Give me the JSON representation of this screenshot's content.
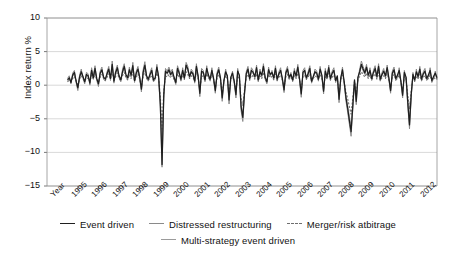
{
  "chart_data": {
    "type": "line",
    "title": "",
    "xlabel": "Year",
    "ylabel": "Index return %",
    "ylim": [
      -15,
      10
    ],
    "yticks": [
      10,
      5,
      0,
      -5,
      -10,
      -15
    ],
    "ytick_labels": [
      "10",
      "5",
      "0",
      "−5",
      "−10",
      "−15"
    ],
    "grid": true,
    "grid_axis": "y",
    "xlim": [
      1994.5,
      2012.6
    ],
    "xticks": [
      1995,
      1996,
      1997,
      1998,
      1999,
      2000,
      2001,
      2002,
      2003,
      2004,
      2005,
      2006,
      2007,
      2008,
      2009,
      2010,
      2011,
      2012
    ],
    "xtick_labels": [
      "Year",
      "1995",
      "1996",
      "1997",
      "1998",
      "1999",
      "2000",
      "2001",
      "2002",
      "2003",
      "2004",
      "2005",
      "2006",
      "2007",
      "2008",
      "2009",
      "2010",
      "2011",
      "2012"
    ],
    "legend_position": "below",
    "series": [
      {
        "name": "Event driven",
        "style": "solid",
        "color": "#1f1f1f",
        "width": 1.25,
        "values": [
          0.8,
          1.1,
          0.4,
          1.5,
          1.9,
          0.6,
          -0.4,
          1.2,
          2.0,
          1.3,
          0.5,
          1.6,
          1.4,
          0.3,
          2.2,
          1.1,
          2.5,
          1.0,
          0.2,
          1.8,
          2.3,
          1.2,
          0.9,
          1.7,
          2.4,
          1.0,
          3.1,
          0.6,
          1.9,
          2.6,
          1.4,
          0.8,
          2.0,
          2.8,
          1.6,
          1.1,
          2.3,
          1.5,
          2.9,
          0.7,
          1.8,
          2.4,
          1.2,
          -0.6,
          1.9,
          3.0,
          1.4,
          0.9,
          1.6,
          2.2,
          0.8,
          1.1,
          2.7,
          1.3,
          -2.8,
          -11.8,
          -1.5,
          2.1,
          1.8,
          2.3,
          1.6,
          2.0,
          1.2,
          0.4,
          2.5,
          1.8,
          0.9,
          2.2,
          1.1,
          3.0,
          2.4,
          1.3,
          2.0,
          1.7,
          0.6,
          2.8,
          1.4,
          -1.2,
          2.1,
          1.9,
          0.8,
          2.5,
          1.5,
          0.9,
          2.2,
          1.0,
          -0.8,
          1.6,
          2.3,
          1.1,
          -1.9,
          0.7,
          2.0,
          1.4,
          -2.2,
          1.2,
          1.8,
          0.6,
          -1.4,
          2.1,
          1.5,
          -3.2,
          -4.8,
          -1.1,
          1.7,
          2.4,
          1.0,
          2.2,
          1.9,
          1.3,
          2.6,
          0.8,
          2.0,
          1.5,
          2.8,
          1.2,
          0.5,
          2.3,
          1.6,
          1.9,
          1.1,
          2.5,
          0.9,
          1.7,
          2.2,
          1.0,
          -0.7,
          1.8,
          2.4,
          1.2,
          1.6,
          0.8,
          2.1,
          1.4,
          2.7,
          1.0,
          -1.3,
          1.9,
          2.2,
          1.1,
          1.7,
          2.5,
          0.6,
          1.3,
          2.0,
          1.8,
          0.9,
          2.4,
          1.5,
          -0.9,
          2.1,
          1.2,
          2.6,
          1.0,
          1.8,
          2.2,
          0.7,
          1.4,
          -2.1,
          1.1,
          2.3,
          0.5,
          -1.8,
          -3.4,
          -5.2,
          -6.9,
          -3.1,
          0.8,
          -2.4,
          1.2,
          2.0,
          3.1,
          2.4,
          1.8,
          2.7,
          1.5,
          2.2,
          1.0,
          1.9,
          2.5,
          1.3,
          2.8,
          0.9,
          1.6,
          2.1,
          1.4,
          2.6,
          1.1,
          -0.8,
          1.8,
          2.3,
          1.0,
          1.5,
          2.2,
          0.6,
          -1.5,
          1.9,
          1.2,
          -2.6,
          -5.9,
          -1.4,
          1.6,
          0.8,
          2.0,
          1.3,
          2.4,
          0.9,
          1.7,
          2.1,
          1.0,
          1.5,
          2.2,
          0.7,
          1.3,
          1.8,
          1.1
        ]
      },
      {
        "name": "Distressed restructuring",
        "style": "solid",
        "color": "#8a8a8a",
        "width": 1.0,
        "values": [
          1.0,
          1.4,
          0.2,
          1.8,
          2.2,
          0.4,
          -0.8,
          1.5,
          2.4,
          1.0,
          0.2,
          1.9,
          1.7,
          0.0,
          2.6,
          1.4,
          2.9,
          0.7,
          -0.2,
          2.1,
          2.7,
          0.9,
          0.6,
          2.0,
          2.8,
          0.7,
          3.6,
          0.3,
          2.2,
          3.0,
          1.1,
          0.5,
          2.4,
          3.2,
          1.3,
          0.8,
          2.7,
          1.2,
          3.4,
          0.4,
          2.1,
          2.8,
          0.9,
          -1.0,
          2.3,
          3.5,
          1.1,
          0.6,
          1.9,
          2.6,
          0.5,
          0.8,
          3.1,
          1.0,
          -3.4,
          -12.2,
          -2.0,
          2.5,
          2.1,
          2.7,
          1.9,
          2.4,
          0.9,
          0.1,
          2.9,
          2.1,
          0.6,
          2.6,
          0.8,
          3.4,
          2.8,
          1.0,
          2.4,
          2.0,
          0.3,
          3.2,
          1.1,
          -1.7,
          2.5,
          2.2,
          0.5,
          2.9,
          1.2,
          0.6,
          2.6,
          0.7,
          -1.2,
          1.9,
          2.7,
          0.8,
          -2.4,
          0.4,
          2.4,
          1.1,
          -2.8,
          0.9,
          2.1,
          0.3,
          -1.9,
          2.5,
          1.2,
          -3.8,
          -5.4,
          -1.5,
          2.0,
          2.8,
          0.7,
          2.6,
          2.2,
          1.0,
          3.0,
          0.5,
          2.4,
          1.2,
          3.2,
          0.9,
          0.2,
          2.7,
          1.3,
          2.2,
          0.8,
          2.9,
          0.6,
          2.0,
          2.6,
          0.7,
          -1.1,
          2.1,
          2.8,
          0.9,
          1.9,
          0.5,
          2.5,
          1.1,
          3.1,
          0.7,
          -1.8,
          2.2,
          2.6,
          0.8,
          2.0,
          2.9,
          0.3,
          1.0,
          2.4,
          2.1,
          0.6,
          2.8,
          1.2,
          -1.3,
          2.5,
          0.9,
          3.0,
          0.7,
          2.1,
          2.6,
          0.4,
          1.1,
          -2.6,
          0.8,
          2.7,
          0.2,
          -2.3,
          -4.0,
          -5.8,
          -7.6,
          -3.6,
          0.5,
          -2.9,
          0.9,
          2.4,
          3.6,
          2.8,
          2.1,
          3.1,
          1.2,
          2.6,
          0.7,
          2.2,
          2.9,
          1.0,
          3.2,
          0.6,
          1.9,
          2.5,
          1.1,
          3.0,
          0.8,
          -1.2,
          2.1,
          2.7,
          0.7,
          1.2,
          2.6,
          0.3,
          -1.9,
          2.2,
          0.9,
          -3.1,
          -6.5,
          -1.8,
          1.9,
          0.5,
          2.4,
          1.0,
          2.8,
          0.6,
          2.0,
          2.5,
          0.7,
          1.2,
          2.6,
          0.4,
          1.0,
          2.1,
          0.8
        ]
      },
      {
        "name": "Merger/risk atbitrage",
        "style": "dashed",
        "color": "#6e6e6e",
        "width": 1.1,
        "values": [
          0.5,
          0.8,
          0.6,
          1.0,
          1.3,
          0.7,
          0.1,
          0.9,
          1.4,
          1.0,
          0.6,
          1.1,
          1.0,
          0.5,
          1.5,
          0.9,
          1.7,
          0.8,
          0.4,
          1.2,
          1.6,
          1.0,
          0.7,
          1.2,
          1.7,
          0.9,
          2.1,
          0.6,
          1.3,
          1.8,
          1.0,
          0.7,
          1.4,
          1.9,
          1.1,
          0.8,
          1.6,
          1.0,
          2.0,
          0.6,
          1.2,
          1.7,
          0.9,
          -0.2,
          1.3,
          2.1,
          1.0,
          0.7,
          1.1,
          1.5,
          0.7,
          0.9,
          1.8,
          1.0,
          -1.6,
          -6.5,
          -0.8,
          1.4,
          1.2,
          1.6,
          1.1,
          1.4,
          0.9,
          0.5,
          1.7,
          1.2,
          0.8,
          1.5,
          0.9,
          2.0,
          1.6,
          1.0,
          1.4,
          1.2,
          0.6,
          1.9,
          1.0,
          -0.6,
          1.4,
          1.3,
          0.7,
          1.7,
          1.1,
          0.8,
          1.5,
          0.9,
          -0.4,
          1.1,
          1.6,
          0.9,
          -1.1,
          0.6,
          1.4,
          1.0,
          -1.3,
          0.9,
          1.2,
          0.6,
          -0.8,
          1.4,
          1.0,
          -2.0,
          -3.0,
          -0.7,
          1.2,
          1.6,
          0.8,
          1.5,
          1.3,
          0.9,
          1.7,
          0.7,
          1.4,
          1.0,
          1.9,
          0.9,
          0.5,
          1.6,
          1.1,
          1.3,
          0.8,
          1.7,
          0.7,
          1.2,
          1.5,
          0.8,
          -0.3,
          1.2,
          1.6,
          0.9,
          1.1,
          0.7,
          1.4,
          1.0,
          1.8,
          0.8,
          -0.7,
          1.3,
          1.5,
          0.9,
          1.2,
          1.7,
          0.6,
          1.0,
          1.4,
          1.2,
          0.8,
          1.6,
          1.1,
          -0.5,
          1.4,
          0.9,
          1.8,
          0.8,
          1.2,
          1.5,
          0.6,
          1.0,
          -1.3,
          0.8,
          1.5,
          0.5,
          -1.0,
          -2.0,
          -3.2,
          -4.3,
          -1.9,
          0.6,
          -1.4,
          0.9,
          1.3,
          2.0,
          1.6,
          1.2,
          1.8,
          1.0,
          1.5,
          0.8,
          1.3,
          1.7,
          0.9,
          1.9,
          0.7,
          1.1,
          1.4,
          1.0,
          1.7,
          0.8,
          -0.4,
          1.2,
          1.6,
          0.8,
          1.0,
          1.5,
          0.5,
          -0.9,
          1.3,
          0.9,
          -1.5,
          -3.5,
          -0.8,
          1.1,
          0.6,
          1.4,
          0.9,
          1.6,
          0.7,
          1.2,
          1.4,
          0.8,
          1.0,
          1.5,
          0.6,
          0.9,
          1.2,
          0.9
        ]
      },
      {
        "name": "Multi-strategy event driven",
        "style": "solid",
        "color": "#9b9b9b",
        "width": 1.0,
        "values": [
          0.7,
          1.0,
          0.5,
          1.3,
          1.7,
          0.6,
          -0.3,
          1.1,
          1.8,
          1.2,
          0.5,
          1.4,
          1.3,
          0.4,
          2.0,
          1.0,
          2.2,
          0.9,
          0.3,
          1.6,
          2.1,
          1.1,
          0.8,
          1.5,
          2.2,
          0.9,
          2.8,
          0.6,
          1.7,
          2.3,
          1.2,
          0.7,
          1.8,
          2.5,
          1.4,
          1.0,
          2.1,
          1.3,
          2.6,
          0.7,
          1.6,
          2.2,
          1.1,
          -0.5,
          1.7,
          2.7,
          1.2,
          0.8,
          1.4,
          2.0,
          0.7,
          1.0,
          2.4,
          1.2,
          -2.5,
          -10.5,
          -1.3,
          1.9,
          1.6,
          2.1,
          1.4,
          1.8,
          1.1,
          0.3,
          2.2,
          1.6,
          0.8,
          2.0,
          1.0,
          2.7,
          2.1,
          1.2,
          1.8,
          1.5,
          0.5,
          2.5,
          1.3,
          -1.0,
          1.9,
          1.7,
          0.7,
          2.2,
          1.4,
          0.8,
          2.0,
          0.9,
          -0.7,
          1.4,
          2.1,
          1.0,
          -1.7,
          0.6,
          1.8,
          1.3,
          -2.0,
          1.1,
          1.6,
          0.5,
          -1.2,
          1.9,
          1.4,
          -2.9,
          -4.4,
          -1.0,
          1.5,
          2.1,
          0.9,
          2.0,
          1.7,
          1.2,
          2.3,
          0.7,
          1.8,
          1.4,
          2.5,
          1.1,
          0.4,
          2.1,
          1.5,
          1.7,
          1.0,
          2.2,
          0.8,
          1.5,
          2.0,
          0.9,
          -0.6,
          1.6,
          2.1,
          1.1,
          1.4,
          0.7,
          1.9,
          1.3,
          2.4,
          0.9,
          -1.1,
          1.7,
          2.0,
          1.0,
          1.5,
          2.2,
          0.5,
          1.2,
          1.8,
          1.6,
          0.8,
          2.1,
          1.4,
          -0.8,
          1.9,
          1.1,
          2.3,
          0.9,
          1.6,
          2.0,
          0.6,
          1.3,
          -1.8,
          1.0,
          2.0,
          0.4,
          -1.6,
          -3.0,
          -4.6,
          -6.1,
          -2.7,
          0.7,
          -2.1,
          1.1,
          1.8,
          2.8,
          2.1,
          1.6,
          2.4,
          1.3,
          2.0,
          0.9,
          1.7,
          2.2,
          1.2,
          2.5,
          0.8,
          1.4,
          1.9,
          1.2,
          2.3,
          1.0,
          -0.7,
          1.6,
          2.0,
          0.9,
          1.3,
          1.9,
          0.5,
          -1.3,
          1.7,
          1.1,
          -2.3,
          -5.2,
          -1.2,
          1.4,
          0.7,
          1.8,
          1.1,
          2.1,
          0.8,
          1.5,
          1.9,
          0.9,
          1.3,
          2.0,
          0.6,
          1.1,
          1.6,
          1.0
        ]
      }
    ]
  },
  "legend": {
    "row1": [
      {
        "label": "Event driven",
        "style": "solid-dark"
      },
      {
        "label": "Distressed restructuring",
        "style": "solid-mid"
      },
      {
        "label": "Merger/risk atbitrage",
        "style": "dashed"
      }
    ],
    "row2": [
      {
        "label": "Multi-strategy event driven",
        "style": "solid-grey"
      }
    ]
  }
}
